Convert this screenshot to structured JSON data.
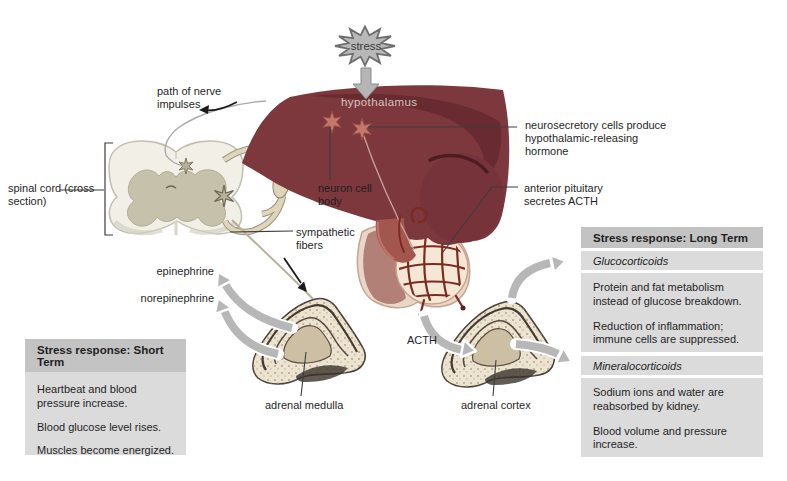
{
  "labels": {
    "stress": "stress",
    "hypothalamus": "hypothalamus",
    "path_of_nerve_impulses": "path of nerve impulses",
    "neurosecretory_cells": "neurosecretory cells produce hypothalamic-releasing hormone",
    "spinal_cord": "spinal cord (cross section)",
    "neuron_cell_body": "neuron cell body",
    "anterior_pituitary": "anterior pituitary secretes ACTH",
    "sympathetic_fibers": "sympathetic fibers",
    "epinephrine": "epinephrine",
    "norepinephrine": "norepinephrine",
    "acth": "ACTH",
    "adrenal_medulla": "adrenal medulla",
    "adrenal_cortex": "adrenal cortex"
  },
  "boxes": {
    "short_term": {
      "title": "Stress response: Short Term",
      "items": [
        "Heartbeat and blood pressure increase.",
        "Blood glucose level rises.",
        "Muscles become energized."
      ]
    },
    "long_term": {
      "title": "Stress response: Long Term",
      "sections": [
        {
          "heading": "Glucocorticoids",
          "items": [
            "Protein and fat metabolism instead of glucose breakdown.",
            "Reduction of inflammation; immune cells are suppressed."
          ]
        },
        {
          "heading": "Mineralocorticoids",
          "items": [
            "Sodium ions and water are reabsorbed by kidney.",
            "Blood volume and pressure increase."
          ]
        }
      ]
    }
  },
  "colors": {
    "hypothalamus": "#7c383d",
    "hypothalamus_fold": "#662a30",
    "pituitary_capillary": "#7c2a23",
    "posterior_lobe": "#b28077",
    "gland_cortex": "#ece3d0",
    "arrow_gray": "#b7b7b7",
    "box_body": "#dbdbdb",
    "box_header": "#c3c3c3",
    "text": "#1f1f1f"
  }
}
